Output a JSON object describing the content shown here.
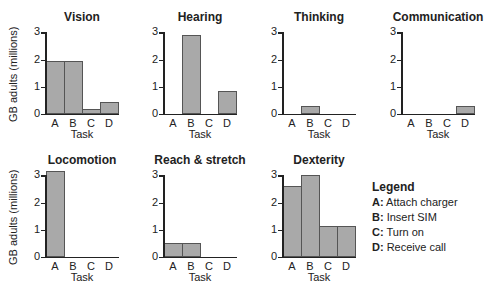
{
  "chart_data": [
    {
      "type": "bar",
      "title": "Vision",
      "categories": [
        "A",
        "B",
        "C",
        "D"
      ],
      "values": [
        1.95,
        1.95,
        0.2,
        0.45
      ],
      "xlabel": "Task",
      "ylabel": "GB adults (millions)",
      "ylim": [
        0,
        3
      ],
      "yticks": [
        0,
        1,
        2,
        3
      ]
    },
    {
      "type": "bar",
      "title": "Hearing",
      "categories": [
        "A",
        "B",
        "C",
        "D"
      ],
      "values": [
        0,
        2.9,
        0,
        0.85
      ],
      "xlabel": "Task",
      "ylabel": "",
      "ylim": [
        0,
        3
      ],
      "yticks": [
        0,
        1,
        2,
        3
      ]
    },
    {
      "type": "bar",
      "title": "Thinking",
      "categories": [
        "A",
        "B",
        "C",
        "D"
      ],
      "values": [
        0,
        0.3,
        0,
        0
      ],
      "xlabel": "Task",
      "ylabel": "",
      "ylim": [
        0,
        3
      ],
      "yticks": [
        0,
        1,
        2,
        3
      ]
    },
    {
      "type": "bar",
      "title": "Communication",
      "categories": [
        "A",
        "B",
        "C",
        "D"
      ],
      "values": [
        0,
        0,
        0,
        0.3
      ],
      "xlabel": "Task",
      "ylabel": "",
      "ylim": [
        0,
        3
      ],
      "yticks": [
        0,
        1,
        2,
        3
      ]
    },
    {
      "type": "bar",
      "title": "Locomotion",
      "categories": [
        "A",
        "B",
        "C",
        "D"
      ],
      "values": [
        3.15,
        0,
        0,
        0
      ],
      "xlabel": "Task",
      "ylabel": "GB adults (millions)",
      "ylim": [
        0,
        3
      ],
      "yticks": [
        0,
        1,
        2,
        3
      ]
    },
    {
      "type": "bar",
      "title": "Reach & stretch",
      "categories": [
        "A",
        "B",
        "C",
        "D"
      ],
      "values": [
        0.5,
        0.5,
        0,
        0
      ],
      "xlabel": "Task",
      "ylabel": "",
      "ylim": [
        0,
        3
      ],
      "yticks": [
        0,
        1,
        2,
        3
      ]
    },
    {
      "type": "bar",
      "title": "Dexterity",
      "categories": [
        "A",
        "B",
        "C",
        "D"
      ],
      "values": [
        2.6,
        3.0,
        1.15,
        1.15
      ],
      "xlabel": "Task",
      "ylabel": "",
      "ylim": [
        0,
        3
      ],
      "yticks": [
        0,
        1,
        2,
        3
      ]
    }
  ],
  "legend": {
    "title": "Legend",
    "items": [
      {
        "key": "A:",
        "label": "Attach charger"
      },
      {
        "key": "B:",
        "label": "Insert SIM"
      },
      {
        "key": "C:",
        "label": "Turn on"
      },
      {
        "key": "D:",
        "label": "Receive call"
      }
    ]
  },
  "colors": {
    "bar": "#a9a9a9",
    "bar_border": "#555555",
    "axis": "#222222"
  },
  "layout": {
    "panels": [
      {
        "x": 45,
        "base": 114
      },
      {
        "x": 163,
        "base": 114
      },
      {
        "x": 282,
        "base": 114
      },
      {
        "x": 401,
        "base": 114
      },
      {
        "x": 45,
        "base": 257
      },
      {
        "x": 163,
        "base": 257
      },
      {
        "x": 282,
        "base": 257
      }
    ],
    "px_per_unit": 27.2,
    "bar_width": 18,
    "axis_width": 74
  }
}
